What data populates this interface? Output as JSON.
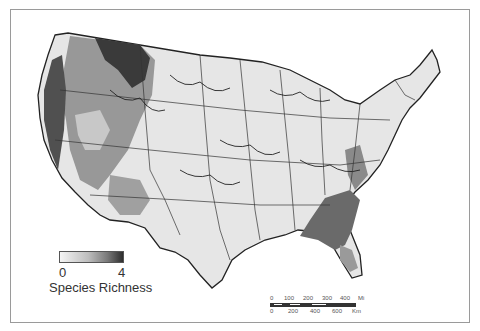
{
  "map": {
    "title": "",
    "subject": "Species richness across the contiguous United States by ecoregion",
    "colors": {
      "background": "#ffffff",
      "land_low": "#e8e8e8",
      "land_mid": "#b0b0b0",
      "land_high": "#6e6e6e",
      "land_max": "#2c2c2c",
      "boundary": "#222222",
      "state_line": "#555555",
      "frame": "#9a9a9a"
    }
  },
  "legend": {
    "min_label": "0",
    "max_label": "4",
    "title": "Species Richness"
  },
  "scale_bar": {
    "miles_labels": [
      "0",
      "100",
      "200",
      "300",
      "400",
      "Mi"
    ],
    "km_labels": [
      "0",
      "200",
      "400",
      "600",
      "Km"
    ]
  }
}
